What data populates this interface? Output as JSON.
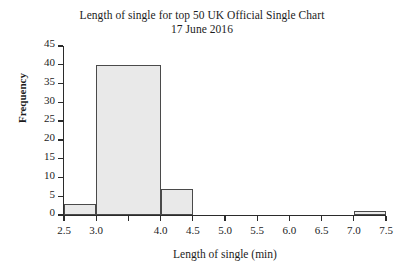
{
  "chart_data": {
    "type": "bar",
    "title": "Length of single for top 50 UK Official Single Chart 17 June 2016",
    "title_lines": [
      "Length of single for top 50 UK Official Single Chart",
      "17 June 2016"
    ],
    "xlabel": "Length of single (min)",
    "ylabel": "Frequency",
    "xlim": [
      2.5,
      7.5
    ],
    "ylim": [
      0,
      45
    ],
    "grid": false,
    "legend": null,
    "xticks": [
      2.5,
      3.0,
      3.5,
      4.0,
      4.5,
      5.0,
      5.5,
      6.0,
      6.5,
      7.0,
      7.5
    ],
    "xtick_labels": [
      "2.5",
      "3.0",
      "",
      "4.0",
      "4.5",
      "5.0",
      "5.5",
      "6.0",
      "6.5",
      "7.0",
      "7.5"
    ],
    "xtick_labels_shown": [
      "2.5",
      "3.0",
      "4.0",
      "4.5",
      "5.0",
      "5.5",
      "6.0",
      "6.5",
      "7.0",
      "7.5"
    ],
    "yticks": [
      0,
      5,
      10,
      15,
      20,
      25,
      30,
      35,
      40,
      45
    ],
    "ytick_labels": [
      "0",
      "5",
      "10",
      "15",
      "20",
      "25",
      "30",
      "35",
      "40",
      "45"
    ],
    "bin_edges": [
      2.5,
      3.0,
      4.0,
      4.5,
      7.0,
      7.5
    ],
    "categories": [
      "2.5-3.0",
      "3.0-4.0",
      "4.0-4.5",
      "7.0-7.5"
    ],
    "values": [
      3,
      40,
      7,
      1
    ],
    "bars": [
      {
        "label": "2.5-3.0",
        "x_start": 2.5,
        "x_end": 3.0,
        "value": 3
      },
      {
        "label": "3.0-4.0",
        "x_start": 3.0,
        "x_end": 4.0,
        "value": 40
      },
      {
        "label": "4.0-4.5",
        "x_start": 4.0,
        "x_end": 4.5,
        "value": 7
      },
      {
        "label": "7.0-7.5",
        "x_start": 7.0,
        "x_end": 7.5,
        "value": 1
      }
    ],
    "colors": {
      "bar_fill": "#e9e9e9",
      "bar_border": "#4a4a4a",
      "axis": "#2b2b2b",
      "text": "#1c1c1c",
      "background": "#ffffff"
    }
  }
}
